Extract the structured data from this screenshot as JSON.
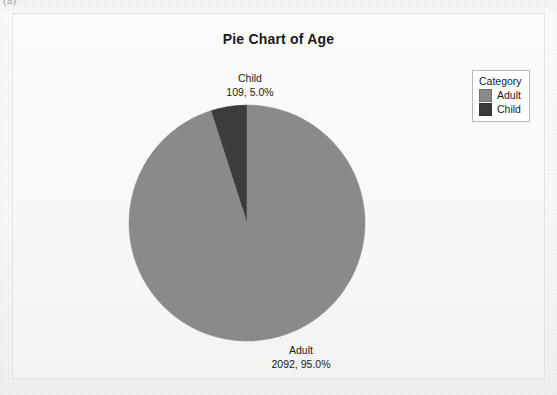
{
  "page": {
    "caption_fragment": "(a)",
    "ghost_text": [
      "crete Variables, Sex",
      "Tally for Discrete Variables: Sex",
      "iables: Class",
      "ries: Sur-",
      "Variables",
      "Discrete Variables: Age"
    ]
  },
  "chart_data": {
    "type": "pie",
    "title": "Pie Chart of Age",
    "xlabel": "",
    "ylabel": "",
    "legend_title": "Category",
    "legend_position": "top-right",
    "grid": false,
    "total": 2201,
    "categories": [
      "Adult",
      "Child"
    ],
    "values": [
      2092,
      109
    ],
    "percents": [
      95.0,
      5.0
    ],
    "colors": [
      "#8a8a8a",
      "#3c3c3c"
    ],
    "slice_labels": [
      {
        "name": "Adult",
        "value_text": "2092, 95.0%"
      },
      {
        "name": "Child",
        "value_text": "109, 5.0%"
      }
    ],
    "start_angle_deg": 90,
    "direction": "counterclockwise"
  }
}
